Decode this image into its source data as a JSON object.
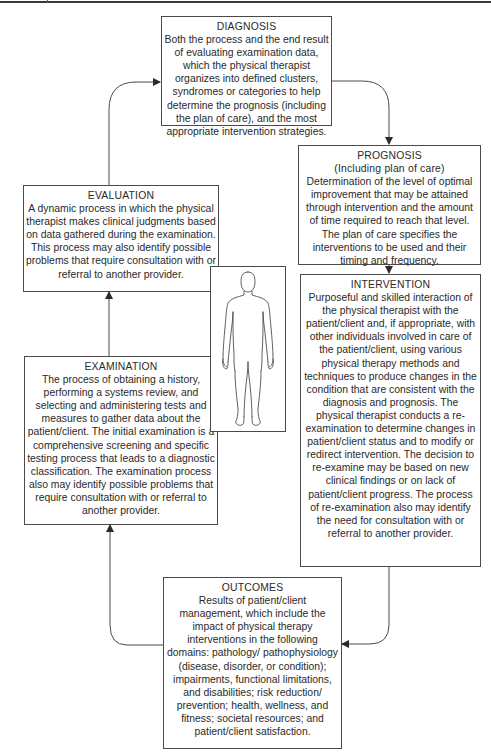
{
  "diagram": {
    "type": "cycle-flowchart",
    "center_figure": "human-body-outline",
    "nodes": {
      "diagnosis": {
        "title": "DIAGNOSIS",
        "subtitle": "",
        "text": "Both the process and the end result of evaluating examination data, which the physical therapist organizes into defined clusters, syndromes or categories to help determine the prognosis (including the plan of care), and the most appropriate intervention strategies."
      },
      "prognosis": {
        "title": "PROGNOSIS",
        "subtitle": "(Including plan of care)",
        "text": "Determination of the level of optimal improvement that may be attained through intervention and the amount of time required to reach that level. The plan of care specifies the interventions to be used and their timing and frequency."
      },
      "intervention": {
        "title": "INTERVENTION",
        "subtitle": "",
        "text": "Purposeful and skilled interaction of the physical therapist with the patient/client and, if appropriate, with other individuals involved in care of the patient/client, using various physical therapy methods and techniques to produce changes in the condition that are consistent with the diagnosis and prognosis. The physical therapist conducts a re-examination to determine changes in patient/client status and to modify or redirect intervention. The decision to re-examine may be based on new clinical findings or on lack of patient/client progress. The process of re-examination also may identify the need for consultation with or referral to another provider."
      },
      "outcomes": {
        "title": "OUTCOMES",
        "subtitle": "",
        "text": "Results of patient/client management, which include the impact of physical therapy interventions in the following domains: pathology/ pathophysiology (disease, disorder, or condition); impairments, functional limitations, and disabilities; risk reduction/ prevention; health, wellness, and fitness; societal resources; and patient/client satisfaction."
      },
      "examination": {
        "title": "EXAMINATION",
        "subtitle": "",
        "text": "The process of obtaining a history, performing a systems review, and selecting and administering tests and measures to gather data about the patient/client. The initial examination is a comprehensive screening and specific testing process that leads to a diagnostic classification. The examination process also may identify possible problems that require consultation with or referral to another provider."
      },
      "evaluation": {
        "title": "EVALUATION",
        "subtitle": "",
        "text": "A dynamic process in which the physical therapist makes clinical judgments based on data gathered during the examination. This process may also identify possible problems that require consultation with or referral to another provider."
      }
    },
    "edges": [
      {
        "from": "diagnosis",
        "to": "prognosis"
      },
      {
        "from": "prognosis",
        "to": "intervention"
      },
      {
        "from": "intervention",
        "to": "outcomes"
      },
      {
        "from": "outcomes",
        "to": "examination"
      },
      {
        "from": "examination",
        "to": "evaluation"
      },
      {
        "from": "evaluation",
        "to": "diagnosis"
      }
    ],
    "colors": {
      "line": "#4a4a4a",
      "text": "#2a2a2a",
      "background": "#ffffff"
    }
  }
}
